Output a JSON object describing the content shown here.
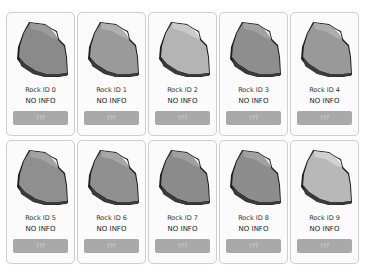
{
  "rocks": [
    {
      "title": "Rock ID 0",
      "info": "NO INFO",
      "button": "???",
      "fill": "#8a8a8a",
      "light": "#9c9c9c"
    },
    {
      "title": "Rock ID 1",
      "info": "NO INFO",
      "button": "???",
      "fill": "#9a9a9a",
      "light": "#b0b0b0"
    },
    {
      "title": "Rock ID 2",
      "info": "NO INFO",
      "button": "???",
      "fill": "#b4b4b4",
      "light": "#cacaca"
    },
    {
      "title": "Rock ID 3",
      "info": "NO INFO",
      "button": "???",
      "fill": "#8e8e8e",
      "light": "#a2a2a2"
    },
    {
      "title": "Rock ID 4",
      "info": "NO INFO",
      "button": "???",
      "fill": "#999999",
      "light": "#adadad"
    },
    {
      "title": "Rock ID 5",
      "info": "NO INFO",
      "button": "???",
      "fill": "#8f8f8f",
      "light": "#a3a3a3"
    },
    {
      "title": "Rock ID 6",
      "info": "NO INFO",
      "button": "???",
      "fill": "#909090",
      "light": "#a6a6a6"
    },
    {
      "title": "Rock ID 7",
      "info": "NO INFO",
      "button": "???",
      "fill": "#8b8b8b",
      "light": "#9f9f9f"
    },
    {
      "title": "Rock ID 8",
      "info": "NO INFO",
      "button": "???",
      "fill": "#8d8d8d",
      "light": "#a1a1a1"
    },
    {
      "title": "Rock ID 9",
      "info": "NO INFO",
      "button": "???",
      "fill": "#b8b8b8",
      "light": "#d0d0d0"
    }
  ]
}
